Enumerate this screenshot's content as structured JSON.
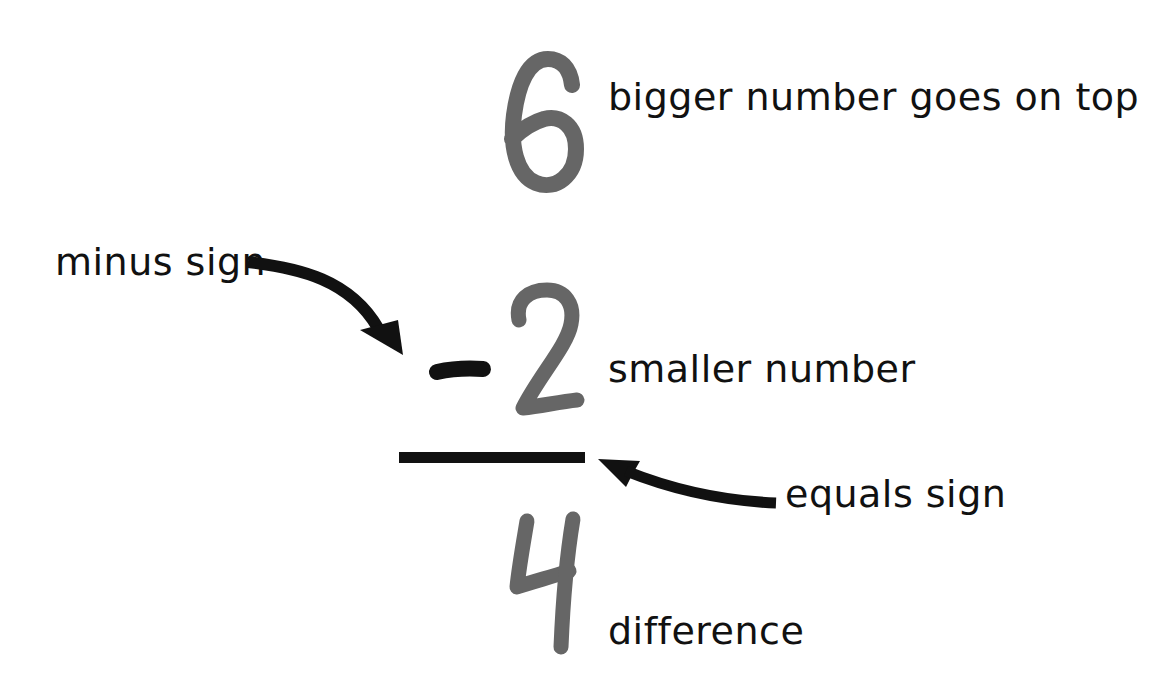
{
  "colors": {
    "digit": "#666666",
    "ink": "#111111",
    "background": "#ffffff"
  },
  "problem": {
    "minuend": "6",
    "operator": "-",
    "subtrahend": "2",
    "result": "4"
  },
  "labels": {
    "minuend": "bigger number goes on top",
    "operator": "minus sign",
    "subtrahend": "smaller number",
    "equals_line": "equals sign",
    "result": "difference"
  },
  "icons": {
    "minus_arrow": "curved-arrow-down-right",
    "equals_arrow": "curved-arrow-left"
  }
}
